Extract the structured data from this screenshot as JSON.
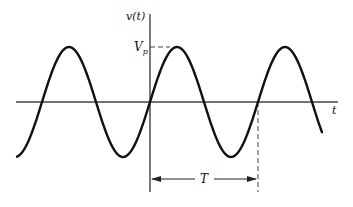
{
  "diagram": {
    "labels": {
      "y_axis": "v(t)",
      "x_axis": "t",
      "peak_main": "V",
      "peak_sub": "p",
      "period": "T"
    },
    "geometry": {
      "origin_x": 150,
      "origin_y": 102,
      "period_px": 108,
      "amplitude_px": 55,
      "x_start": 17,
      "x_end": 322
    },
    "colors": {
      "stroke": "#111111",
      "axis": "#333333",
      "background": "#ffffff"
    }
  }
}
